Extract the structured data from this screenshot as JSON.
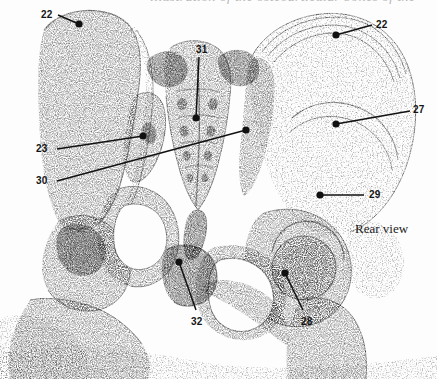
{
  "page": {
    "width": 437,
    "height": 379,
    "background_color": "#fdfdfd",
    "ink_color": "#141414",
    "stipple_color": "#8d8d8d"
  },
  "caption": {
    "cropped_top_line": "illustration of the osteoarticular bones of the"
  },
  "figure": {
    "view_label": "Rear view",
    "style": "stippled-halftone-anatomical-drawing"
  },
  "callouts": [
    {
      "id": "callout-22-left",
      "number": "22",
      "label_x": 41,
      "label_y": 10,
      "dot_x": 79,
      "dot_y": 24,
      "line_from_x": 58,
      "line_from_y": 15
    },
    {
      "id": "callout-22-right",
      "number": "22",
      "label_x": 376,
      "label_y": 20,
      "dot_x": 336,
      "dot_y": 35,
      "line_from_x": 372,
      "line_from_y": 25
    },
    {
      "id": "callout-31",
      "number": "31",
      "label_x": 196,
      "label_y": 45,
      "dot_x": 196,
      "dot_y": 118,
      "line_from_x": 199,
      "line_from_y": 57
    },
    {
      "id": "callout-27",
      "number": "27",
      "label_x": 413,
      "label_y": 105,
      "dot_x": 336,
      "dot_y": 124,
      "line_from_x": 410,
      "line_from_y": 111
    },
    {
      "id": "callout-23",
      "number": "23",
      "label_x": 36,
      "label_y": 144,
      "dot_x": 143,
      "dot_y": 136,
      "line_from_x": 57,
      "line_from_y": 149
    },
    {
      "id": "callout-30",
      "number": "30",
      "label_x": 36,
      "label_y": 176,
      "dot_x": 246,
      "dot_y": 130,
      "line_from_x": 57,
      "line_from_y": 181
    },
    {
      "id": "callout-29",
      "number": "29",
      "label_x": 369,
      "label_y": 190,
      "dot_x": 320,
      "dot_y": 195,
      "line_from_x": 364,
      "line_from_y": 195
    },
    {
      "id": "callout-28",
      "number": "28",
      "label_x": 301,
      "label_y": 317,
      "dot_x": 285,
      "dot_y": 273,
      "line_from_x": 303,
      "line_from_y": 310
    },
    {
      "id": "callout-32",
      "number": "32",
      "label_x": 191,
      "label_y": 317,
      "dot_x": 179,
      "dot_y": 262,
      "line_from_x": 196,
      "line_from_y": 310
    }
  ]
}
